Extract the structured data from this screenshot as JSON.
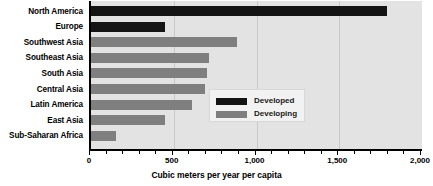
{
  "chart_data": {
    "type": "bar",
    "orientation": "horizontal",
    "title": "",
    "xlabel": "Cubic meters per year per capita",
    "ylabel": "",
    "xlim": [
      0,
      2000
    ],
    "xticks": [
      0,
      500,
      1000,
      1500,
      2000
    ],
    "xticklabels": [
      "0",
      "500",
      "1,000",
      "1,500",
      "2,000"
    ],
    "minor_tick_interval": 100,
    "grid": true,
    "grid_axis": "x",
    "legend_position": "center-right",
    "categories": [
      "North America",
      "Europe",
      "Southwest Asia",
      "Southeast Asia",
      "South Asia",
      "Central Asia",
      "Latin America",
      "East Asia",
      "Sub-Saharan Africa"
    ],
    "values": [
      1790,
      450,
      880,
      710,
      700,
      690,
      610,
      450,
      150
    ],
    "groups": [
      "Developed",
      "Developed",
      "Developing",
      "Developing",
      "Developing",
      "Developing",
      "Developing",
      "Developing",
      "Developing"
    ],
    "series": [
      {
        "name": "Developed",
        "color": "#141414",
        "points": [
          {
            "category": "North America",
            "value": 1790
          },
          {
            "category": "Europe",
            "value": 450
          }
        ]
      },
      {
        "name": "Developing",
        "color": "#7f7f7f",
        "points": [
          {
            "category": "Southwest Asia",
            "value": 880
          },
          {
            "category": "Southeast Asia",
            "value": 710
          },
          {
            "category": "South Asia",
            "value": 700
          },
          {
            "category": "Central Asia",
            "value": 690
          },
          {
            "category": "Latin America",
            "value": 610
          },
          {
            "category": "East Asia",
            "value": 450
          },
          {
            "category": "Sub-Saharan Africa",
            "value": 150
          }
        ]
      }
    ]
  },
  "legend": {
    "entries": [
      {
        "label": "Developed",
        "color": "#141414"
      },
      {
        "label": "Developing",
        "color": "#7f7f7f"
      }
    ]
  },
  "colors": {
    "developed": "#141414",
    "developing": "#7f7f7f",
    "plot_background": "#e3e3e3",
    "axis": "#000000",
    "gridline": "#c9c9c9",
    "legend_background": "#f2f2f2"
  }
}
